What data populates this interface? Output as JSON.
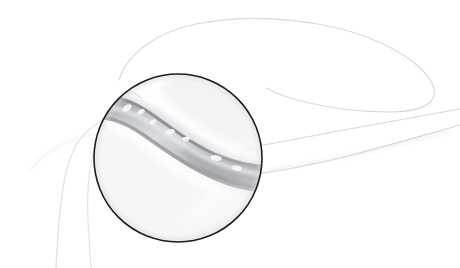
{
  "figure": {
    "style": "graphite pencil line drawing, grayscale",
    "canvas": {
      "width": 460,
      "height": 268,
      "background": "#ffffff"
    }
  },
  "palette": {
    "background": "#ffffff",
    "inset_border": "#1c1c1c",
    "faint_outline": "#d8d9dd",
    "faint_outline_soft": "#e3e4e8",
    "band_edge_dark": "#8e9096",
    "band_mid": "#b3b5ba",
    "band_light": "#d6d8dc",
    "band_highlight": "#f4f5f6",
    "inset_fill": "#fbfbfc",
    "inset_shade": "#eceef0"
  },
  "inset": {
    "name": "magnified-circle-inset",
    "shape": "circle",
    "center_x": 178,
    "center_y": 158,
    "radius": 84,
    "border_width": 1.6,
    "border_color": "#1c1c1c"
  },
  "structures": [
    {
      "name": "outer-body-contour",
      "description": "large faint wing-shaped outline sweeping from upper-left across the top to the right edge",
      "stroke": "#d8d9dd",
      "stroke_width": 1.2
    },
    {
      "name": "lower-left-contour",
      "description": "faint contour descending at the lower left of the frame",
      "stroke": "#dddee2",
      "stroke_width": 1.2
    },
    {
      "name": "vessel-upper-line",
      "description": "thin line running from the inset toward the right edge, upper of a pair",
      "stroke": "#d4d5da",
      "stroke_width": 1.1
    },
    {
      "name": "vessel-lower-line",
      "description": "thin line running from the inset toward the right edge, lower of a pair",
      "stroke": "#d4d5da",
      "stroke_width": 1.1
    },
    {
      "name": "magnified-band",
      "description": "shaded S-curved band (vessel/tendon) crossing the magnified circle from upper-left to lower-right",
      "edge_color": "#8e9096",
      "fill_color": "#c2c4c9"
    }
  ],
  "highlights": [
    {
      "name": "band-highlight-1",
      "cx": 127,
      "cy": 108,
      "rx": 5,
      "ry": 3,
      "angle": -32
    },
    {
      "name": "band-highlight-2",
      "cx": 141,
      "cy": 112,
      "rx": 4,
      "ry": 2.4,
      "angle": -30
    },
    {
      "name": "band-highlight-3",
      "cx": 153,
      "cy": 122,
      "rx": 3.5,
      "ry": 2.2,
      "angle": -26
    },
    {
      "name": "band-highlight-4",
      "cx": 170,
      "cy": 132,
      "rx": 5,
      "ry": 2.6,
      "angle": -18
    },
    {
      "name": "band-highlight-5",
      "cx": 186,
      "cy": 139,
      "rx": 4,
      "ry": 2.4,
      "angle": -10
    },
    {
      "name": "band-highlight-6",
      "cx": 216,
      "cy": 158,
      "rx": 6,
      "ry": 2.8,
      "angle": 8
    },
    {
      "name": "band-highlight-7",
      "cx": 237,
      "cy": 168,
      "rx": 5,
      "ry": 2.6,
      "angle": 12
    }
  ]
}
